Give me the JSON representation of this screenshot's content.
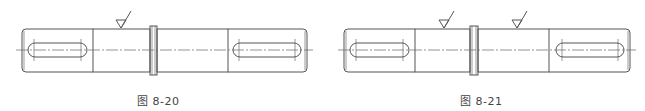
{
  "figures": [
    {
      "id": "fig-8-20",
      "caption": "图 8-20",
      "roughness_symbols": 1,
      "description": "Shaft with keyways at both ends, collar in the middle, one surface roughness mark on left middle section"
    },
    {
      "id": "fig-8-21",
      "caption": "图 8-21",
      "roughness_symbols": 2,
      "description": "Shaft with keyways at both ends, collar in the middle, surface roughness marks on both middle sections"
    }
  ],
  "colors": {
    "line": "#555555",
    "centerline": "#666666",
    "background": "#ffffff",
    "caption": "#444444"
  }
}
